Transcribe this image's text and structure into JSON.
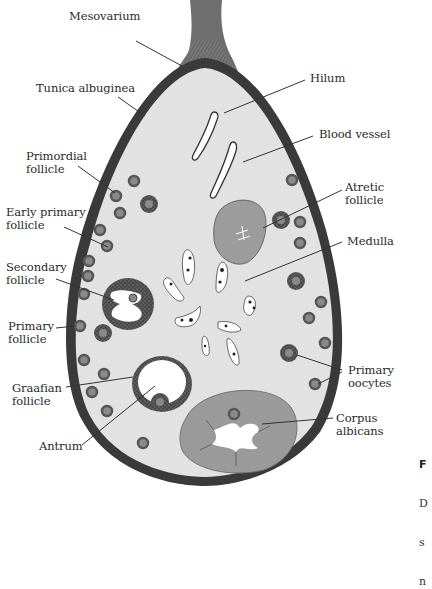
{
  "diagram": {
    "colors": {
      "background": "#ffffff",
      "stroma": "#e2e2e2",
      "tunica": "#3a3a3a",
      "mesovarium": "#6e6e6e",
      "corpus_fill": "#9a9a9a",
      "atretic_fill": "#9c9c9c",
      "follicle_ring": "#5a5a5a",
      "oocyte": "#8a8a8a",
      "leader": "#333333",
      "text": "#2a2a2a"
    },
    "labels": [
      {
        "id": "mesovarium",
        "text": "Mesovarium",
        "x": 69,
        "y": 17
      },
      {
        "id": "hilum",
        "text": "Hilum",
        "x": 310,
        "y": 74
      },
      {
        "id": "tunica-albuginea",
        "text": "Tunica albuginea",
        "x": 36,
        "y": 83
      },
      {
        "id": "blood-vessel",
        "text": "Blood vessel",
        "x": 319,
        "y": 128
      },
      {
        "id": "primordial-follicle",
        "text": "Primordial\nfollicle",
        "x": 26,
        "y": 150
      },
      {
        "id": "atretic-follicle",
        "text": "Atretic\nfollicle",
        "x": 345,
        "y": 181
      },
      {
        "id": "early-primary-follicle",
        "text": "Early primary\nfollicle",
        "x": 6,
        "y": 206
      },
      {
        "id": "medulla",
        "text": "Medulla",
        "x": 347,
        "y": 235
      },
      {
        "id": "secondary-follicle",
        "text": "Secondary\nfollicle",
        "x": 6,
        "y": 261
      },
      {
        "id": "primary-follicle",
        "text": "Primary\nfollicle",
        "x": 8,
        "y": 322
      },
      {
        "id": "primary-oocytes",
        "text": "Primary\noocytes",
        "x": 348,
        "y": 366
      },
      {
        "id": "graafian-follicle",
        "text": "Graafian\nfollicle",
        "x": 12,
        "y": 381
      },
      {
        "id": "antrum",
        "text": "Antrum",
        "x": 39,
        "y": 438
      },
      {
        "id": "corpus-albicans",
        "text": "Corpus\nalbicans",
        "x": 336,
        "y": 413
      }
    ],
    "caption_fragment": {
      "figure_letter": "F",
      "lines": [
        "D",
        "s",
        "n"
      ]
    }
  }
}
